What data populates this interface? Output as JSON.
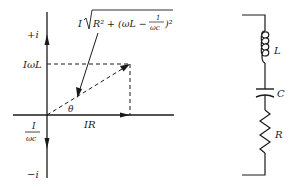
{
  "phasor_diagram": {
    "axis_labels": {
      "positive_imag": "+i",
      "negative_imag": "−i"
    },
    "inductive_label": "IωL",
    "capacitive_label": {
      "numerator": "I",
      "denominator": "ωc"
    },
    "resistive_label": "IR",
    "angle_label": "θ",
    "magnitude_label": {
      "prefix": "I",
      "radicand": "R² + (ωL −",
      "fraction_numerator": "1",
      "fraction_denominator": "ωc",
      "suffix": ")²"
    }
  },
  "circuit": {
    "components": [
      {
        "type": "inductor",
        "label": "L"
      },
      {
        "type": "capacitor",
        "label": "C"
      },
      {
        "type": "resistor",
        "label": "R"
      }
    ]
  },
  "colors": {
    "ink": "#1a1a1a",
    "background": "#ffffff"
  }
}
